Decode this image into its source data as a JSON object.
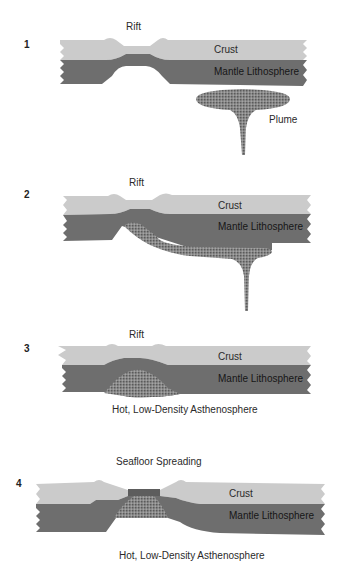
{
  "figure": {
    "panels": [
      {
        "number": "1",
        "top_label": "Rift",
        "crust_label": "Crust",
        "mantle_label": "Mantle Lithosphere",
        "plume_label": "Plume"
      },
      {
        "number": "2",
        "top_label": "Rift",
        "crust_label": "Crust",
        "mantle_label": "Mantle Lithosphere"
      },
      {
        "number": "3",
        "top_label": "Rift",
        "crust_label": "Crust",
        "mantle_label": "Mantle Lithosphere",
        "bottom_label": "Hot, Low-Density Asthenosphere"
      },
      {
        "number": "4",
        "top_label": "Seafloor Spreading",
        "crust_label": "Crust",
        "mantle_label": "Mantle Lithosphere",
        "bottom_label": "Hot, Low-Density Asthenosphere"
      }
    ],
    "colors": {
      "crust": "#cbcbcb",
      "mantle": "#6e6e6e",
      "plume": "#7d7d7d",
      "background": "#ffffff"
    }
  }
}
